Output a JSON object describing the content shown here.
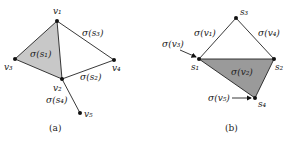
{
  "panel_a": {
    "caption": "(a)",
    "vertices": [
      "v1",
      "v2",
      "v3",
      "v4",
      "v5"
    ],
    "labels": {
      "v1": "v₁",
      "v2": "v₂",
      "v3": "v₃",
      "v4": "v₄",
      "v5": "v₅",
      "face_s1": "σ(s₁)",
      "edge_s3": "σ(s₃)",
      "edge_s2": "σ(s₂)",
      "edge_s4": "σ(s₄)"
    },
    "edges": [
      [
        "v1",
        "v2"
      ],
      [
        "v1",
        "v3"
      ],
      [
        "v2",
        "v3"
      ],
      [
        "v1",
        "v4"
      ],
      [
        "v2",
        "v4"
      ],
      [
        "v2",
        "v5"
      ]
    ],
    "shaded_face": [
      "v1",
      "v2",
      "v3"
    ],
    "shade_color": "#c8c8c8"
  },
  "panel_b": {
    "caption": "(b)",
    "vertices": [
      "s1",
      "s2",
      "s3",
      "s4"
    ],
    "labels": {
      "s1": "s₁",
      "s2": "s₂",
      "s3": "s₃",
      "s4": "s₄",
      "edge_v1": "σ(v₁)",
      "edge_v4": "σ(v₄)",
      "face_v2": "σ(v₂)",
      "arrow_v3": "σ(v₃)",
      "arrow_v5": "σ(v₅)"
    },
    "edges": [
      [
        "s1",
        "s3"
      ],
      [
        "s3",
        "s2"
      ],
      [
        "s1",
        "s2"
      ],
      [
        "s1",
        "s4"
      ],
      [
        "s2",
        "s4"
      ]
    ],
    "shaded_face": [
      "s1",
      "s2",
      "s4"
    ],
    "shade_color": "#9a9a9a"
  }
}
